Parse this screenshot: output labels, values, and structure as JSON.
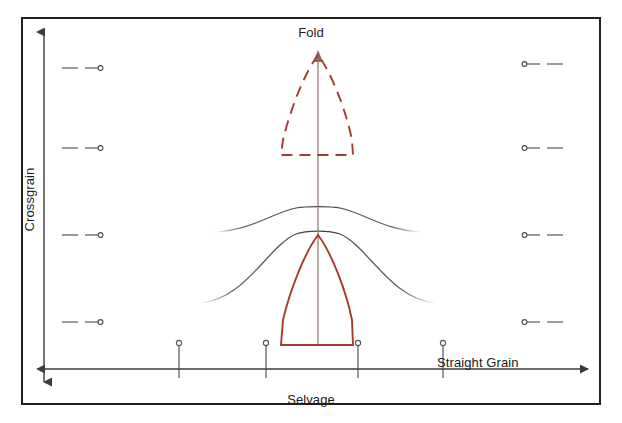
{
  "diagram": {
    "labels": {
      "fold": "Fold",
      "crossgrain": "Crossgrain",
      "straight_grain": "Straight Grain",
      "selvage": "Selvage"
    },
    "colors": {
      "border": "#231f20",
      "axis": "#3b3b3b",
      "pattern_red": "#a83a2c",
      "pattern_red_dashed": "#a03c32",
      "grain_curve": "#4a4a4a",
      "fold_line": "#9a7d78",
      "mark": "#4a4a4a",
      "background": "#ffffff"
    },
    "frame": {
      "x": 22,
      "y": 18,
      "width": 578,
      "height": 386,
      "stroke_width": 2
    },
    "axes": {
      "vertical": {
        "x": 44,
        "y_top": 32,
        "y_bottom": 382,
        "arrow_top": true,
        "arrow_bottom": true
      },
      "horizontal": {
        "y": 369,
        "x_left": 44,
        "x_right": 588,
        "arrow_left": true,
        "arrow_right": true
      }
    },
    "fold_line": {
      "x": 318,
      "y_top": 52,
      "y_bottom": 345
    },
    "fold_arrow": {
      "x": 318,
      "y": 52,
      "direction": "up"
    },
    "pattern_dashed": {
      "style": "dashed",
      "apex_x": 318,
      "apex_y": 54,
      "left_x": 281,
      "right_x": 353,
      "base_y": 155
    },
    "pattern_solid": {
      "style": "solid",
      "apex_x": 318,
      "apex_y": 234,
      "left_x": 281,
      "right_x": 353,
      "base_y": 345
    },
    "grain_curves": [
      {
        "id": "curve-upper",
        "peak_x": 318,
        "peak_y": 207,
        "span_x_start": 215,
        "span_x_end": 421
      },
      {
        "id": "curve-lower",
        "peak_x": 318,
        "peak_y": 232,
        "span_x_start": 200,
        "span_x_end": 436
      }
    ],
    "pins": [
      {
        "id": "pin-1",
        "x": 179,
        "head_y": 343,
        "tip_y": 378
      },
      {
        "id": "pin-2",
        "x": 266,
        "head_y": 343,
        "tip_y": 378
      },
      {
        "id": "pin-3",
        "x": 358,
        "head_y": 343,
        "tip_y": 378
      },
      {
        "id": "pin-4",
        "x": 443,
        "head_y": 343,
        "tip_y": 378
      }
    ],
    "left_marks": [
      {
        "id": "mark-left-1",
        "y": 68
      },
      {
        "id": "mark-left-2",
        "y": 148
      },
      {
        "id": "mark-left-3",
        "y": 235
      },
      {
        "id": "mark-left-4",
        "y": 322
      }
    ],
    "right_marks": [
      {
        "id": "mark-right-1",
        "y": 64
      },
      {
        "id": "mark-right-2",
        "y": 148
      },
      {
        "id": "mark-right-3",
        "y": 235
      },
      {
        "id": "mark-right-4",
        "y": 322
      }
    ]
  }
}
